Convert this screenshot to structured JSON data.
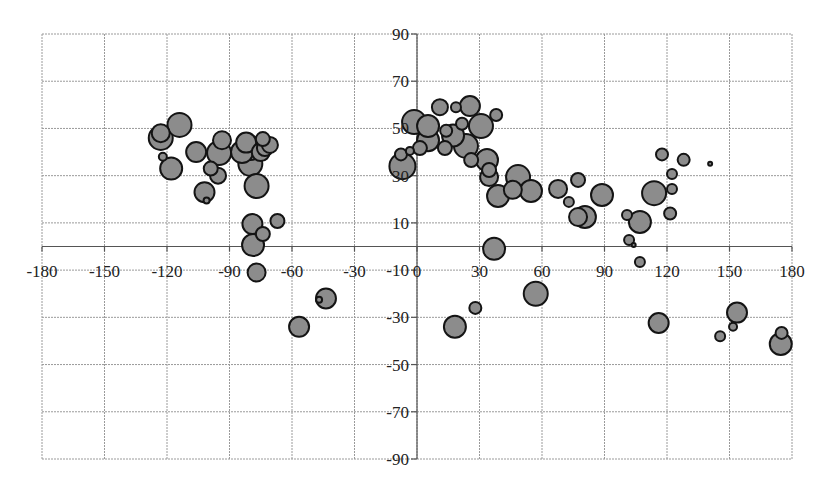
{
  "chart_data": {
    "type": "scatter",
    "subtype": "bubble",
    "title": "",
    "xlabel": "",
    "ylabel": "",
    "xlim": [
      -180,
      180
    ],
    "ylim": [
      -90,
      90
    ],
    "x_ticks": [
      -180,
      -150,
      -120,
      -90,
      -60,
      -30,
      0,
      30,
      60,
      90,
      120,
      150,
      180
    ],
    "y_ticks": [
      90,
      70,
      50,
      30,
      10,
      -10,
      -30,
      -50,
      -70,
      -90
    ],
    "x_tick_labels": [
      "-180",
      "-150",
      "-120",
      "-90",
      "-60",
      "-30",
      "0",
      "30",
      "60",
      "90",
      "120",
      "150",
      "180"
    ],
    "y_tick_labels": [
      "90",
      "70",
      "50",
      "30",
      "10",
      "-10",
      "-30",
      "-50",
      "-70",
      "-90"
    ],
    "grid": true,
    "legend": null,
    "bubble_fill": "#8c8c8c",
    "bubble_stroke": "#141414",
    "series": [
      {
        "name": "points",
        "points": [
          {
            "x": -123,
            "y": 48,
            "size": 9
          },
          {
            "x": -123,
            "y": 46,
            "size": 12
          },
          {
            "x": -114,
            "y": 51.5,
            "size": 12
          },
          {
            "x": -122,
            "y": 38,
            "size": 4
          },
          {
            "x": -118,
            "y": 33,
            "size": 11
          },
          {
            "x": -106,
            "y": 40,
            "size": 10
          },
          {
            "x": -102,
            "y": 23,
            "size": 10
          },
          {
            "x": -101,
            "y": 19.5,
            "size": 3
          },
          {
            "x": -93.6,
            "y": 45,
            "size": 9
          },
          {
            "x": -99,
            "y": 33,
            "size": 7
          },
          {
            "x": -95.5,
            "y": 30,
            "size": 8
          },
          {
            "x": -95,
            "y": 39.6,
            "size": 12
          },
          {
            "x": -84,
            "y": 40,
            "size": 11
          },
          {
            "x": -82,
            "y": 44,
            "size": 10
          },
          {
            "x": -80,
            "y": 35,
            "size": 12
          },
          {
            "x": -75,
            "y": 40,
            "size": 9
          },
          {
            "x": -73,
            "y": 41.7,
            "size": 8
          },
          {
            "x": -74,
            "y": 45.5,
            "size": 7
          },
          {
            "x": -70.6,
            "y": 43,
            "size": 8
          },
          {
            "x": -80,
            "y": 41.7,
            "size": 12
          },
          {
            "x": -77,
            "y": 25.6,
            "size": 12
          },
          {
            "x": -79,
            "y": 9.5,
            "size": 10
          },
          {
            "x": -74,
            "y": 5.3,
            "size": 7
          },
          {
            "x": -67,
            "y": 10.8,
            "size": 7
          },
          {
            "x": -78.7,
            "y": 0.6,
            "size": 11
          },
          {
            "x": -77,
            "y": -11,
            "size": 9
          },
          {
            "x": -47,
            "y": -22.6,
            "size": 3
          },
          {
            "x": -43.7,
            "y": -22,
            "size": 10
          },
          {
            "x": -56.6,
            "y": -34,
            "size": 10
          },
          {
            "x": -7.7,
            "y": 39,
            "size": 6
          },
          {
            "x": -3.4,
            "y": 40.5,
            "size": 4
          },
          {
            "x": -7,
            "y": 34,
            "size": 13
          },
          {
            "x": -1.4,
            "y": 52.7,
            "size": 12
          },
          {
            "x": 1.4,
            "y": 41.7,
            "size": 7
          },
          {
            "x": 5.3,
            "y": 45,
            "size": 11
          },
          {
            "x": 5.3,
            "y": 51,
            "size": 11
          },
          {
            "x": 11,
            "y": 59,
            "size": 8
          },
          {
            "x": 18.7,
            "y": 59,
            "size": 5
          },
          {
            "x": 25.4,
            "y": 59.5,
            "size": 10
          },
          {
            "x": 14,
            "y": 49,
            "size": 6
          },
          {
            "x": 13.4,
            "y": 41.7,
            "size": 7
          },
          {
            "x": 21.6,
            "y": 52,
            "size": 6
          },
          {
            "x": 17.3,
            "y": 47,
            "size": 11
          },
          {
            "x": 38,
            "y": 55.7,
            "size": 6
          },
          {
            "x": 30.7,
            "y": 51,
            "size": 12
          },
          {
            "x": 26,
            "y": 36.6,
            "size": 7
          },
          {
            "x": 23.5,
            "y": 42.6,
            "size": 12
          },
          {
            "x": 34.6,
            "y": 29.4,
            "size": 9
          },
          {
            "x": 34.6,
            "y": 32.4,
            "size": 7
          },
          {
            "x": 33.6,
            "y": 36.6,
            "size": 11
          },
          {
            "x": 38.9,
            "y": 21.4,
            "size": 11
          },
          {
            "x": 46,
            "y": 24,
            "size": 9
          },
          {
            "x": 54.7,
            "y": 23.5,
            "size": 11
          },
          {
            "x": 48.5,
            "y": 29.4,
            "size": 12
          },
          {
            "x": 67.7,
            "y": 24.4,
            "size": 9
          },
          {
            "x": 77.3,
            "y": 28.2,
            "size": 7
          },
          {
            "x": 72.9,
            "y": 18.9,
            "size": 5
          },
          {
            "x": 77.3,
            "y": 12.5,
            "size": 9
          },
          {
            "x": 80.6,
            "y": 12.5,
            "size": 11
          },
          {
            "x": 88.8,
            "y": 21.8,
            "size": 11
          },
          {
            "x": 37,
            "y": -1,
            "size": 11
          },
          {
            "x": 117.6,
            "y": 39,
            "size": 6
          },
          {
            "x": 128,
            "y": 36.7,
            "size": 6
          },
          {
            "x": 140.7,
            "y": 35,
            "size": 2
          },
          {
            "x": 122.4,
            "y": 30.7,
            "size": 5
          },
          {
            "x": 122.4,
            "y": 24.4,
            "size": 5
          },
          {
            "x": 113.8,
            "y": 22.6,
            "size": 12
          },
          {
            "x": 121.5,
            "y": 14,
            "size": 6
          },
          {
            "x": 100.8,
            "y": 13.3,
            "size": 5
          },
          {
            "x": 107,
            "y": 10.4,
            "size": 11
          },
          {
            "x": 101.8,
            "y": 2.8,
            "size": 5
          },
          {
            "x": 104,
            "y": 0.6,
            "size": 2
          },
          {
            "x": 107,
            "y": -6.6,
            "size": 5
          },
          {
            "x": 57,
            "y": -20,
            "size": 12
          },
          {
            "x": 28,
            "y": -26,
            "size": 6
          },
          {
            "x": 18.2,
            "y": -34,
            "size": 11
          },
          {
            "x": 116,
            "y": -32.4,
            "size": 10
          },
          {
            "x": 153.6,
            "y": -28,
            "size": 10
          },
          {
            "x": 151.7,
            "y": -34,
            "size": 4
          },
          {
            "x": 145.5,
            "y": -38,
            "size": 5
          },
          {
            "x": 175,
            "y": -36.6,
            "size": 6
          },
          {
            "x": 174.6,
            "y": -41.3,
            "size": 11
          }
        ]
      }
    ]
  }
}
